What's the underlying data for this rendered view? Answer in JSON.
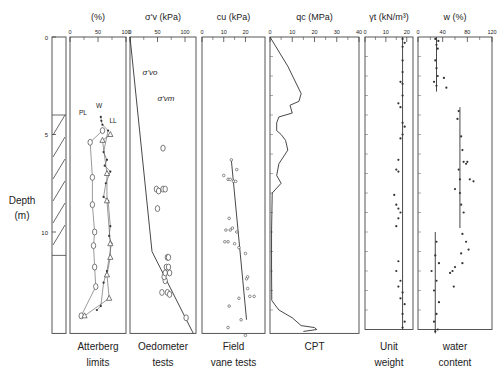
{
  "figure": {
    "depth_label": [
      "Depth",
      "(m)"
    ],
    "depth_ticks": [
      0,
      5,
      10
    ],
    "depth_px_per_m": 19.5,
    "depth_top_px": 37,
    "depth_bottom_m": 15.2,
    "hatched_layer_m": [
      4.0,
      11.2
    ]
  },
  "chart_data": [
    {
      "type": "scatter",
      "panel": "atterberg",
      "title": "(%)",
      "caption": [
        "Atterberg",
        "limits"
      ],
      "xlim": [
        0,
        100
      ],
      "xticks": [
        0,
        50,
        100
      ],
      "ylabel": "Depth (m)",
      "annotations": [
        "PL",
        "W",
        "LL"
      ],
      "series": [
        {
          "name": "PL",
          "marker": "circle",
          "points": [
            [
              58,
              4.8
            ],
            [
              36,
              5.4
            ],
            [
              40,
              7.2
            ],
            [
              40,
              8.6
            ],
            [
              44,
              10.0
            ],
            [
              42,
              10.7
            ],
            [
              44,
              11.8
            ],
            [
              46,
              12.8
            ],
            [
              20,
              14.3
            ]
          ]
        },
        {
          "name": "W",
          "marker": "dot",
          "points": [
            [
              55,
              4.1
            ],
            [
              56,
              4.3
            ],
            [
              58,
              4.5
            ],
            [
              68,
              4.8
            ],
            [
              60,
              5.9
            ],
            [
              66,
              6.3
            ],
            [
              62,
              6.6
            ],
            [
              72,
              6.9
            ],
            [
              64,
              7.5
            ],
            [
              60,
              8.2
            ],
            [
              68,
              8.4
            ],
            [
              72,
              9.7
            ],
            [
              70,
              10.2
            ],
            [
              74,
              10.6
            ],
            [
              66,
              12.0
            ],
            [
              60,
              12.6
            ],
            [
              55,
              13.8
            ],
            [
              48,
              14.0
            ]
          ]
        },
        {
          "name": "LL",
          "marker": "triangle",
          "points": [
            [
              72,
              5.0
            ],
            [
              58,
              5.3
            ],
            [
              66,
              7.0
            ],
            [
              66,
              8.4
            ],
            [
              72,
              10.6
            ],
            [
              72,
              11.3
            ],
            [
              66,
              12.2
            ],
            [
              70,
              13.4
            ],
            [
              26,
              14.3
            ]
          ]
        }
      ]
    },
    {
      "type": "scatter",
      "panel": "oedometer",
      "title": "σ'v (kPa)",
      "caption": [
        "Oedometer",
        "tests"
      ],
      "xlim": [
        0,
        120
      ],
      "xticks": [
        0,
        50,
        100
      ],
      "annotations": [
        "σ'vo",
        "σ'vm"
      ],
      "line_sigma_vo": [
        [
          0,
          0
        ],
        [
          40,
          11.0
        ],
        [
          115,
          15.2
        ]
      ],
      "series": [
        {
          "name": "σ'vm",
          "marker": "circle",
          "points": [
            [
              60,
              5.7
            ],
            [
              48,
              7.8
            ],
            [
              52,
              7.9
            ],
            [
              60,
              7.8
            ],
            [
              64,
              7.8
            ],
            [
              50,
              8.8
            ],
            [
              68,
              11.3
            ],
            [
              70,
              11.3
            ],
            [
              66,
              11.8
            ],
            [
              70,
              11.8
            ],
            [
              72,
              12.1
            ],
            [
              64,
              12.5
            ],
            [
              58,
              13.1
            ],
            [
              68,
              13.1
            ],
            [
              72,
              13.2
            ],
            [
              102,
              14.4
            ],
            [
              62,
              12.3
            ],
            [
              64,
              12.1
            ]
          ]
        }
      ]
    },
    {
      "type": "scatter",
      "panel": "field_vane",
      "title": "cu (kPa)",
      "caption": [
        "Field",
        "vane tests"
      ],
      "xlim": [
        0,
        29
      ],
      "xticks": [
        0,
        10,
        20
      ],
      "trend_line": [
        [
          13.5,
          6.3
        ],
        [
          20.5,
          14.5
        ]
      ],
      "series": [
        {
          "name": "cu",
          "points": [
            [
              13.5,
              6.3
            ],
            [
              10,
              7.1
            ],
            [
              12,
              7.3
            ],
            [
              13,
              7.3
            ],
            [
              14.5,
              7.4
            ],
            [
              15.5,
              7.4
            ],
            [
              16,
              6.8
            ],
            [
              12.5,
              9.3
            ],
            [
              11,
              9.9
            ],
            [
              13,
              9.9
            ],
            [
              14,
              9.8
            ],
            [
              16,
              10.0
            ],
            [
              10.5,
              10.5
            ],
            [
              12,
              10.5
            ],
            [
              15,
              10.6
            ],
            [
              17,
              10.8
            ],
            [
              20,
              11.1
            ],
            [
              20.5,
              12.4
            ],
            [
              21,
              12.3
            ],
            [
              21,
              12.9
            ],
            [
              22,
              13.3
            ],
            [
              24,
              13.3
            ],
            [
              17,
              13.4
            ],
            [
              12.5,
              13.8
            ],
            [
              18,
              14.5
            ],
            [
              12,
              14.9
            ],
            [
              20,
              15.3
            ]
          ]
        }
      ]
    },
    {
      "type": "line",
      "panel": "cpt",
      "title": "qc (MPa)",
      "caption": [
        "CPT"
      ],
      "xlim": [
        0,
        40
      ],
      "xticks": [
        0,
        10,
        20,
        30,
        40
      ],
      "series": [
        {
          "name": "qc",
          "points": [
            [
              0,
              0
            ],
            [
              8,
              1.5
            ],
            [
              14,
              2.9
            ],
            [
              13,
              3.3
            ],
            [
              9,
              3.5
            ],
            [
              10,
              3.9
            ],
            [
              4,
              4.1
            ],
            [
              3,
              4.4
            ],
            [
              3,
              4.8
            ],
            [
              5,
              5.0
            ],
            [
              7,
              5.3
            ],
            [
              8,
              5.8
            ],
            [
              4,
              6.5
            ],
            [
              3,
              7.1
            ],
            [
              5,
              7.5
            ],
            [
              1,
              8.0
            ],
            [
              0.7,
              10
            ],
            [
              0.7,
              12
            ],
            [
              0.8,
              13.5
            ],
            [
              2,
              13.7
            ],
            [
              4,
              14.0
            ],
            [
              10,
              14.4
            ],
            [
              14,
              14.8
            ],
            [
              20,
              14.9
            ],
            [
              21,
              15.0
            ],
            [
              15,
              15.1
            ]
          ]
        }
      ]
    },
    {
      "type": "scatter",
      "panel": "unit_weight",
      "title": "γt (kN/m³)",
      "caption": [
        "Unit",
        "weight"
      ],
      "xlim": [
        0,
        23
      ],
      "xticks": [
        0,
        10,
        20
      ],
      "mean_line_x": 18,
      "series": [
        {
          "name": "γt",
          "points": [
            [
              18,
              0.1
            ],
            [
              19,
              0.3
            ],
            [
              18,
              0.5
            ],
            [
              18,
              1.2
            ],
            [
              18,
              1.8
            ],
            [
              17,
              2.3
            ],
            [
              18,
              2.4
            ],
            [
              18,
              3.0
            ],
            [
              16,
              3.4
            ],
            [
              17,
              3.6
            ],
            [
              18,
              4.4
            ],
            [
              19,
              4.6
            ],
            [
              18,
              5.0
            ],
            [
              17,
              5.2
            ],
            [
              16,
              6.3
            ],
            [
              15,
              6.8
            ],
            [
              16,
              6.9
            ],
            [
              14,
              8.1
            ],
            [
              15,
              8.6
            ],
            [
              16,
              8.8
            ],
            [
              17,
              9.0
            ],
            [
              16,
              9.3
            ],
            [
              15,
              9.7
            ],
            [
              16,
              11.5
            ],
            [
              15,
              12.0
            ],
            [
              17,
              12.5
            ],
            [
              16,
              12.8
            ],
            [
              18,
              13.1
            ],
            [
              17,
              13.4
            ],
            [
              19,
              13.7
            ],
            [
              18,
              14.2
            ],
            [
              19,
              14.6
            ],
            [
              18,
              14.9
            ]
          ]
        }
      ]
    },
    {
      "type": "scatter",
      "panel": "water_content",
      "title": "w (%)",
      "caption": [
        "water",
        "content"
      ],
      "xlim": [
        0,
        120
      ],
      "xticks": [
        0,
        40,
        80,
        120
      ],
      "mean_line_segments": [
        [
          30,
          0,
          2.8
        ],
        [
          68,
          3.6,
          9.8
        ],
        [
          28,
          10.0,
          15.2
        ]
      ],
      "series": [
        {
          "name": "w",
          "points": [
            [
              28,
              0.1
            ],
            [
              33,
              0.2
            ],
            [
              30,
              0.4
            ],
            [
              32,
              0.6
            ],
            [
              28,
              1.2
            ],
            [
              30,
              1.6
            ],
            [
              32,
              2.0
            ],
            [
              26,
              2.3
            ],
            [
              30,
              2.5
            ],
            [
              42,
              2.1
            ],
            [
              46,
              2.6
            ],
            [
              66,
              3.8
            ],
            [
              64,
              4.2
            ],
            [
              70,
              5.1
            ],
            [
              72,
              5.8
            ],
            [
              74,
              6.4
            ],
            [
              78,
              6.5
            ],
            [
              80,
              6.4
            ],
            [
              66,
              6.8
            ],
            [
              68,
              7.3
            ],
            [
              60,
              7.8
            ],
            [
              84,
              7.3
            ],
            [
              90,
              7.4
            ],
            [
              68,
              8.0
            ],
            [
              70,
              8.6
            ],
            [
              74,
              9.0
            ],
            [
              72,
              10.1
            ],
            [
              78,
              10.5
            ],
            [
              82,
              10.9
            ],
            [
              70,
              11.1
            ],
            [
              72,
              11.6
            ],
            [
              60,
              11.8
            ],
            [
              56,
              12.0
            ],
            [
              52,
              12.1
            ],
            [
              58,
              12.8
            ],
            [
              30,
              10.5
            ],
            [
              28,
              11.2
            ],
            [
              34,
              11.6
            ],
            [
              22,
              12.0
            ],
            [
              30,
              12.5
            ],
            [
              26,
              13.0
            ],
            [
              34,
              13.6
            ],
            [
              30,
              14.2
            ],
            [
              26,
              14.6
            ],
            [
              32,
              15.0
            ],
            [
              28,
              15.1
            ]
          ]
        }
      ]
    }
  ]
}
